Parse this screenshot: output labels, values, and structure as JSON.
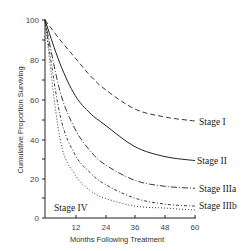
{
  "chart_data": {
    "type": "line",
    "title": "",
    "xlabel": "Months Following Treatment",
    "ylabel": "Cumulative Proportion Surviving",
    "xlim": [
      0,
      60
    ],
    "ylim": [
      0,
      100
    ],
    "x_ticks": [
      12,
      24,
      36,
      48,
      60
    ],
    "y_ticks": [
      0,
      20,
      40,
      60,
      80,
      100
    ],
    "grid": false,
    "legend": "inline labels at line ends",
    "x": [
      0,
      6,
      12,
      18,
      24,
      36,
      48,
      60
    ],
    "series": [
      {
        "name": "Stage I",
        "style": "dashed",
        "values": [
          100,
          90,
          81,
          72,
          65,
          55,
          51,
          49
        ]
      },
      {
        "name": "Stage II",
        "style": "solid",
        "values": [
          100,
          78,
          62,
          53,
          47,
          36,
          31,
          29
        ]
      },
      {
        "name": "Stage IIIa",
        "style": "dashdot",
        "values": [
          100,
          64,
          45,
          34,
          27,
          19,
          16,
          15
        ]
      },
      {
        "name": "Stage IIIb",
        "style": "dotdash",
        "values": [
          100,
          52,
          32,
          23,
          17,
          10,
          7,
          6
        ]
      },
      {
        "name": "Stage IV",
        "style": "dotted",
        "values": [
          100,
          40,
          22,
          14,
          10,
          6,
          5,
          4
        ]
      }
    ]
  },
  "labels": {
    "x_axis": "Months Following Treatment",
    "y_axis": "Cumulative Proportion Surviving",
    "stage1": "Stage I",
    "stage2": "Stage II",
    "stage3a": "Stage IIIa",
    "stage3b": "Stage IIIb",
    "stage4": "Stage IV",
    "yt0": "0",
    "yt20": "20",
    "yt40": "40",
    "yt60": "60",
    "yt80": "80",
    "yt100": "100",
    "xt12": "12",
    "xt24": "24",
    "xt36": "36",
    "xt48": "48",
    "xt60": "60"
  }
}
